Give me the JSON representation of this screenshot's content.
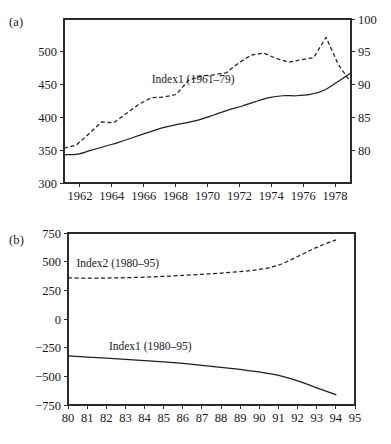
{
  "figure": {
    "panels": [
      {
        "tag": "(a)",
        "name": "panel-a"
      },
      {
        "tag": "(b)",
        "name": "panel-b"
      }
    ]
  },
  "chart_data": [
    {
      "type": "line",
      "title": "",
      "panel_label": "(a)",
      "xlabel": "",
      "ylabel": "",
      "y2label": "",
      "grid": false,
      "legend": "inline-annotations",
      "xlim": [
        1961,
        1979
      ],
      "ylim": [
        300,
        550
      ],
      "y2lim": [
        75,
        100
      ],
      "xticks": [
        1962,
        1964,
        1966,
        1968,
        1970,
        1972,
        1974,
        1976,
        1978
      ],
      "xticklabels": [
        "1962",
        "1964",
        "1966",
        "1968",
        "1970",
        "1972",
        "1974",
        "1976",
        "1978"
      ],
      "yticks": [
        300,
        350,
        400,
        450,
        500
      ],
      "yticklabels": [
        "300",
        "350",
        "400",
        "450",
        "500"
      ],
      "y2ticks": [
        80,
        85,
        90,
        95,
        100
      ],
      "y2ticklabels": [
        "80",
        "85",
        "90",
        "95",
        "100"
      ],
      "x": [
        1961,
        1962,
        1963,
        1964,
        1965,
        1966,
        1967,
        1968,
        1969,
        1970,
        1971,
        1972,
        1973,
        1974,
        1975,
        1976,
        1977,
        1978,
        1979
      ],
      "series": [
        {
          "name": "Index1 (1961–79)",
          "axis": "left",
          "style": "solid",
          "label_x": 1969.1,
          "label_y": 452,
          "values": [
            343,
            344,
            350,
            356,
            362,
            369,
            376,
            383,
            388,
            392,
            397,
            404,
            411,
            417,
            424,
            430,
            433,
            433,
            435,
            441,
            454,
            468
          ]
        },
        {
          "name": "Index2 (1961–79)",
          "axis": "right",
          "style": "dashed",
          "label_x": 1967.0,
          "label_y": 521,
          "values": [
            80.3,
            80.8,
            82.5,
            84.3,
            84.2,
            85.6,
            87.0,
            88.0,
            88.1,
            88.5,
            90.7,
            91.3,
            91.5,
            91.8,
            93.3,
            94.5,
            94.8,
            94.0,
            93.4,
            93.8,
            94.1,
            97.2,
            93.0,
            90.3
          ]
        }
      ]
    },
    {
      "type": "line",
      "title": "",
      "panel_label": "(b)",
      "xlabel": "",
      "ylabel": "",
      "grid": false,
      "legend": "inline-annotations",
      "xlim": [
        80,
        95
      ],
      "ylim": [
        -750,
        750
      ],
      "xticks": [
        80,
        81,
        82,
        83,
        84,
        85,
        86,
        87,
        88,
        89,
        90,
        91,
        92,
        93,
        94,
        95
      ],
      "xticklabels": [
        "80",
        "81",
        "82",
        "83",
        "84",
        "85",
        "86",
        "87",
        "88",
        "89",
        "90",
        "91",
        "92",
        "93",
        "94",
        "95"
      ],
      "yticks": [
        -750,
        -500,
        -250,
        0,
        250,
        500,
        750
      ],
      "yticklabels": [
        "−750",
        "−500",
        "−250",
        "0",
        "250",
        "500",
        "750"
      ],
      "x": [
        80,
        81,
        82,
        83,
        84,
        85,
        86,
        87,
        88,
        89,
        90,
        91,
        92,
        93,
        94
      ],
      "series": [
        {
          "name": "Index2 (1980–95)",
          "axis": "left",
          "style": "dashed",
          "label_x": 82.6,
          "label_y": 455,
          "values": [
            358,
            357,
            357,
            360,
            365,
            372,
            380,
            390,
            400,
            414,
            432,
            470,
            545,
            625,
            690
          ]
        },
        {
          "name": "Index1 (1980–95)",
          "axis": "left",
          "style": "solid",
          "label_x": 84.3,
          "label_y": -272,
          "values": [
            -322,
            -332,
            -342,
            -352,
            -362,
            -374,
            -388,
            -404,
            -421,
            -440,
            -462,
            -492,
            -540,
            -600,
            -660
          ]
        }
      ]
    }
  ]
}
